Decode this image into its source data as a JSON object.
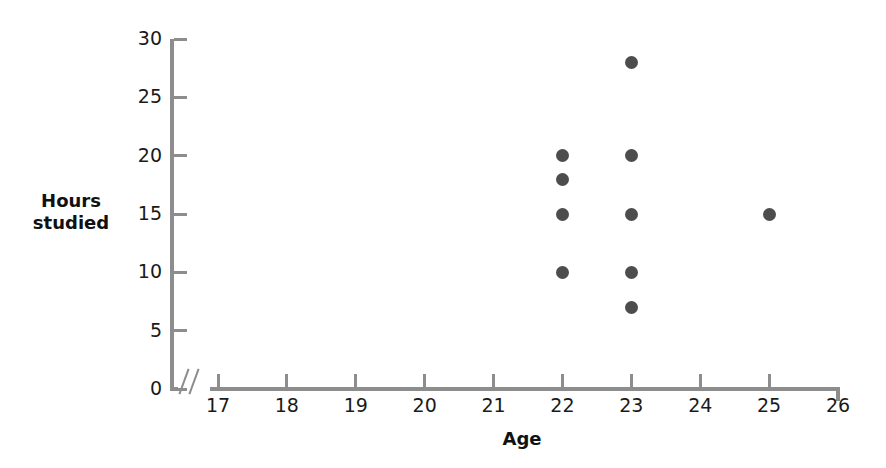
{
  "chart_data": {
    "type": "scatter",
    "title": "",
    "xlabel": "Age",
    "ylabel": "Hours studied",
    "ylabel_lines": [
      "Hours",
      "studied"
    ],
    "xlim": [
      17,
      26
    ],
    "ylim": [
      0,
      30
    ],
    "x_ticks": [
      17,
      18,
      19,
      20,
      21,
      22,
      23,
      24,
      25,
      26
    ],
    "x_tick_labels": [
      "17",
      "18",
      "19",
      "20",
      "21",
      "22",
      "23",
      "24",
      "25",
      "26"
    ],
    "y_ticks": [
      0,
      5,
      10,
      15,
      20,
      25,
      30
    ],
    "y_tick_labels": [
      "0",
      "5",
      "10",
      "15",
      "20",
      "25",
      "30"
    ],
    "grid": false,
    "legend": "none",
    "axis_break": true,
    "axis_break_note": "scale break between origin and first tick on x-axis",
    "marker_color": "#4d4d4d",
    "axis_color": "#8d8d8d",
    "background_color": "#ffffff",
    "points": [
      {
        "x": 22,
        "y": 20
      },
      {
        "x": 22,
        "y": 18
      },
      {
        "x": 22,
        "y": 15
      },
      {
        "x": 22,
        "y": 10
      },
      {
        "x": 23,
        "y": 28
      },
      {
        "x": 23,
        "y": 20
      },
      {
        "x": 23,
        "y": 15
      },
      {
        "x": 23,
        "y": 10
      },
      {
        "x": 23,
        "y": 7
      },
      {
        "x": 25,
        "y": 15
      }
    ]
  }
}
